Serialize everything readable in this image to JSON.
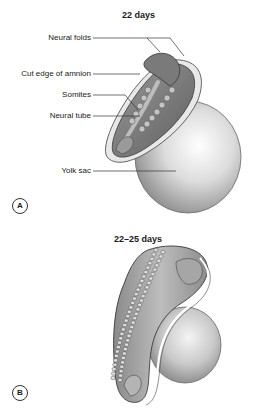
{
  "panels": [
    {
      "letter": "A",
      "title": "22 days",
      "labels": [
        "Neural folds",
        "Cut edge of amnion",
        "Somites",
        "Neural tube",
        "Yolk sac"
      ]
    },
    {
      "letter": "B",
      "title": "22–25 days"
    }
  ]
}
